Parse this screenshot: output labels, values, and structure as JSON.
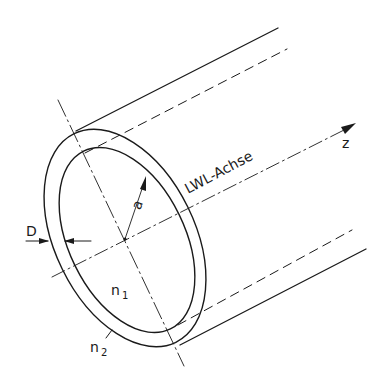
{
  "diagram": {
    "type": "optical-fiber-cylinder",
    "colors": {
      "line": "#1a1a1a",
      "background": "#ffffff"
    },
    "labels": {
      "axis_label": "LWL-Achse",
      "z_label": "z",
      "core_radius": "a",
      "cladding_thickness": "D",
      "core_index": "n",
      "core_index_sub": "1",
      "cladding_index": "n",
      "cladding_index_sub": "2"
    }
  }
}
